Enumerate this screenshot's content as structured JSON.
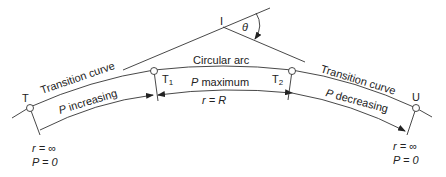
{
  "diagram": {
    "points": {
      "T": "T",
      "T1": "T",
      "T1_sub": "1",
      "T2": "T",
      "T2_sub": "2",
      "U": "U",
      "I": "I"
    },
    "angle_label": "θ",
    "labels": {
      "circular_arc": "Circular arc",
      "transition_left": "Transition curve",
      "transition_right": "Transition curve",
      "p_increasing_var": "P",
      "p_increasing_text": " increasing",
      "p_maximum_var": "P",
      "p_maximum_text": " maximum",
      "r_eq_R": "r = R",
      "p_decreasing_var": "P",
      "p_decreasing_text": " decreasing"
    },
    "end_conditions": {
      "left_r": "r = ∞",
      "left_P": "P = 0",
      "right_r": "r = ∞",
      "right_P": "P = 0"
    }
  }
}
